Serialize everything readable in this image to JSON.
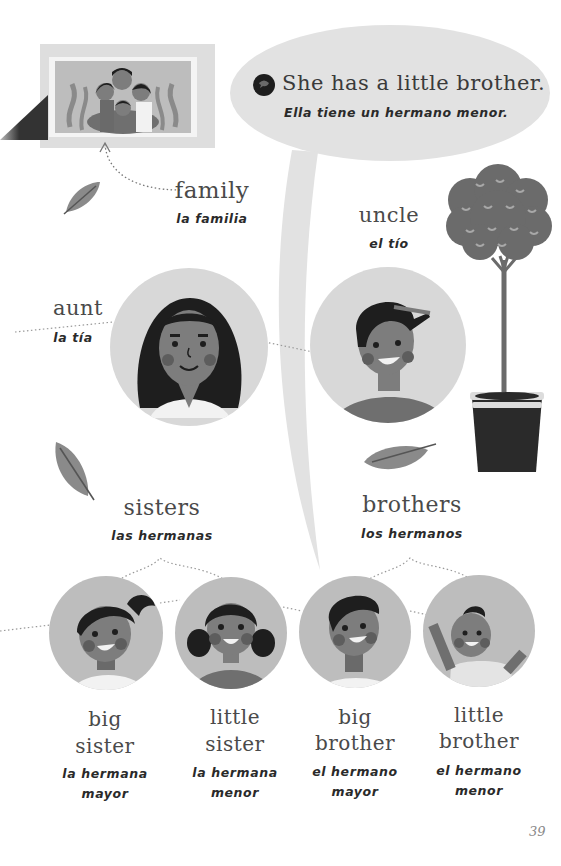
{
  "colors": {
    "background": "#ffffff",
    "circle_bg": "#d8d8d8",
    "bubble_bg": "#e2e2e2",
    "skin": "#7d7d7d",
    "hair": "#1e1e1e",
    "cheek": "#5d5d5d",
    "leaf": "#8a8a8a",
    "tree": "#6b6b6b",
    "pot": "#2a2a2a"
  },
  "speech_bubble": {
    "icon": "speech-bubble-icon",
    "english": "She has a little brother.",
    "spanish": "Ella tiene un hermano menor."
  },
  "family": {
    "english": "family",
    "spanish": "la familia"
  },
  "uncle": {
    "english": "uncle",
    "spanish": "el tío"
  },
  "aunt": {
    "english": "aunt",
    "spanish": "la tía"
  },
  "sisters": {
    "english": "sisters",
    "spanish": "las hermanas"
  },
  "brothers": {
    "english": "brothers",
    "spanish": "los hermanos"
  },
  "siblings": [
    {
      "english_line1": "big",
      "english_line2": "sister",
      "spanish_line1": "la hermana",
      "spanish_line2": "mayor"
    },
    {
      "english_line1": "little",
      "english_line2": "sister",
      "spanish_line1": "la hermana",
      "spanish_line2": "menor"
    },
    {
      "english_line1": "big",
      "english_line2": "brother",
      "spanish_line1": "el hermano",
      "spanish_line2": "mayor"
    },
    {
      "english_line1": "little",
      "english_line2": "brother",
      "spanish_line1": "el hermano",
      "spanish_line2": "menor"
    }
  ],
  "page_number": "39"
}
